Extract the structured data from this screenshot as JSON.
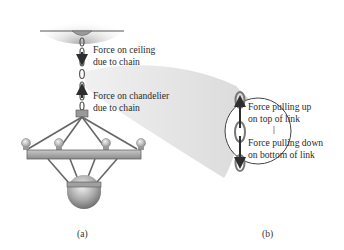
{
  "figure": {
    "panel_a": {
      "caption": "(a)",
      "labels": {
        "force_on_ceiling_line1": "Force on ceiling",
        "force_on_ceiling_line2": "due to chain",
        "force_on_chandelier_line1": "Force on chandelier",
        "force_on_chandelier_line2": "due to chain"
      }
    },
    "panel_b": {
      "caption": "(b)",
      "labels": {
        "force_up_line1": "Force pulling up",
        "force_up_line2": "on top of link",
        "force_down_line1": "Force pulling down",
        "force_down_line2": "on bottom of link"
      }
    },
    "colors": {
      "ceiling_shadow": "#b8b8b8",
      "magnify_beam": "#e6e6e6",
      "metal": "#9a9a9a",
      "arrow": "#2e2e2e"
    }
  }
}
